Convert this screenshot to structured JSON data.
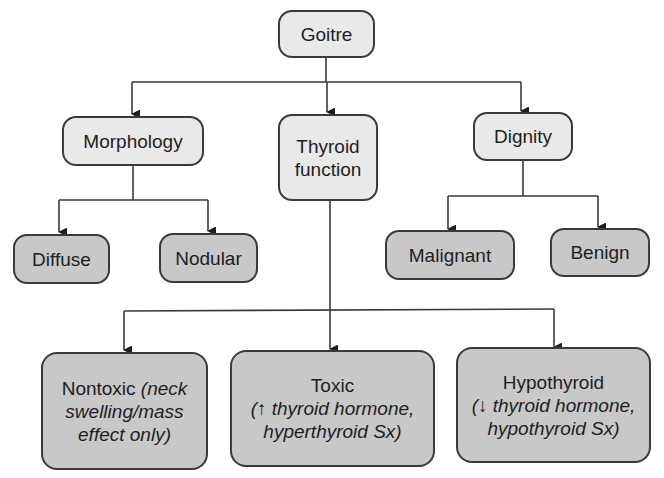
{
  "diagram": {
    "root": {
      "label": "Goitre"
    },
    "categories": [
      {
        "label": "Morphology",
        "children": [
          "Diffuse",
          "Nodular"
        ]
      },
      {
        "label_line1": "Thyroid",
        "label_line2": "function"
      },
      {
        "label": "Dignity",
        "children": [
          "Malignant",
          "Benign"
        ]
      }
    ],
    "morphology_children": {
      "diffuse": "Diffuse",
      "nodular": "Nodular"
    },
    "dignity_children": {
      "malignant": "Malignant",
      "benign": "Benign"
    },
    "function_children": {
      "nontoxic": {
        "title": "Nontoxic",
        "note_l1": "(neck",
        "note_l2": "swelling/mass",
        "note_l3": "effect only)"
      },
      "toxic": {
        "title": "Toxic",
        "note_l1": "(↑ thyroid hormone,",
        "note_l2": "hyperthyroid Sx)"
      },
      "hypothyroid": {
        "title": "Hypothyroid",
        "note_l1": "(↓ thyroid hormone,",
        "note_l2": "hypothyroid Sx)"
      }
    },
    "colors": {
      "category_fill": "#e9e9e9",
      "leaf_fill": "#c8c8c8",
      "stroke": "#3a3a3a"
    }
  }
}
